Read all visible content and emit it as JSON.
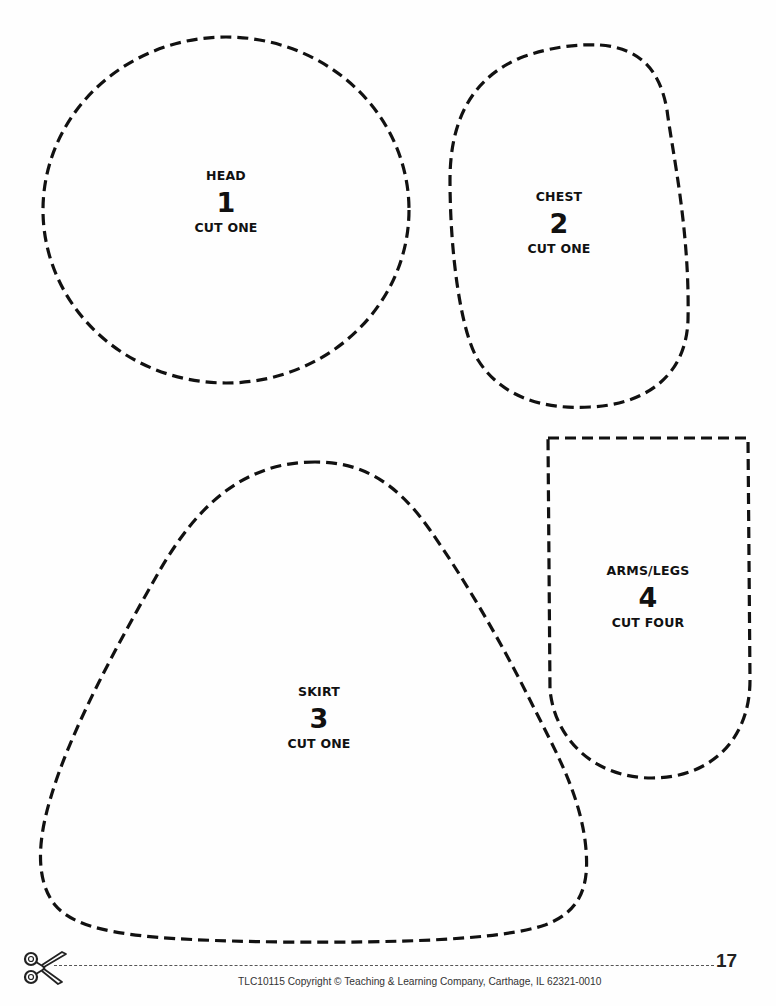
{
  "pieces": [
    {
      "name": "HEAD",
      "number": "1",
      "instruction": "CUT ONE"
    },
    {
      "name": "CHEST",
      "number": "2",
      "instruction": "CUT ONE"
    },
    {
      "name": "SKIRT",
      "number": "3",
      "instruction": "CUT ONE"
    },
    {
      "name": "ARMS/LEGS",
      "number": "4",
      "instruction": "CUT FOUR"
    }
  ],
  "footer": {
    "page_number": "17",
    "copyright": "TLC10115 Copyright © Teaching & Learning Company, Carthage, IL  62321-0010",
    "cut_icon": "scissors-icon"
  },
  "colors": {
    "ink": "#111111",
    "paper": "#fefefe"
  }
}
